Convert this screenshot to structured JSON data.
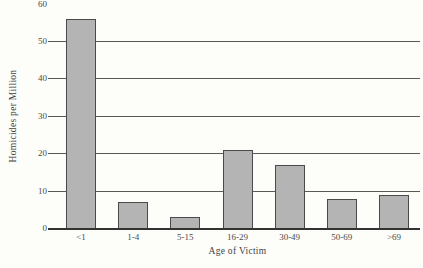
{
  "chart_data": {
    "type": "bar",
    "title": "",
    "xlabel": "Age of Victim",
    "ylabel": "Homicides per Million",
    "categories": [
      "<1",
      "1-4",
      "5-15",
      "16-29",
      "30-49",
      "50-69",
      ">69"
    ],
    "values": [
      56,
      7,
      3,
      21,
      17,
      8,
      9
    ],
    "ylim": [
      0,
      60
    ],
    "yticks": [
      0,
      10,
      20,
      30,
      40,
      50,
      60
    ],
    "gridlines": [
      10,
      20,
      30,
      40,
      50
    ],
    "grid": "horizontal",
    "legend": "none",
    "colors": {
      "bar_fill": "#b4b4b4",
      "bar_border": "#4a4a4a",
      "gridline": "#595959",
      "axis_line": "#333333",
      "text": "#3d3d3d",
      "background": "#fdfdfa"
    }
  }
}
